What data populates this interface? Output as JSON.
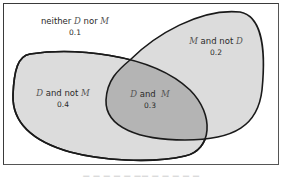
{
  "diagram": {
    "type": "venn",
    "sets": [
      "D",
      "M"
    ],
    "regions": {
      "neither": {
        "prefix": "neither ",
        "a": "D",
        "mid": " nor ",
        "b": "M",
        "value": "0.1"
      },
      "m_not_d": {
        "a": "M",
        "mid": " and not ",
        "b": "D",
        "value": "0.2"
      },
      "d_not_m": {
        "a": "D",
        "mid": " and not ",
        "b": "M",
        "value": "0.4"
      },
      "d_and_m": {
        "a": "D",
        "mid": " and  ",
        "b": "M",
        "value": "0.3"
      }
    },
    "colors": {
      "frame": "#3a3a3a",
      "outline": "#1a1a1a",
      "set_fill": "#dcdcdc",
      "overlap_fill": "#b4b4b4",
      "background": "#ffffff"
    },
    "caption": "— — — —  — —— — — — — —"
  }
}
